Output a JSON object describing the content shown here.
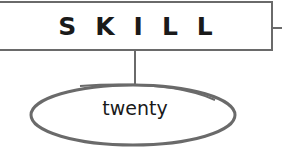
{
  "diagram": {
    "top_node": {
      "label": "SKILL"
    },
    "child_node": {
      "label": "twenty"
    },
    "colors": {
      "stroke": "#6a6a6a",
      "text": "#1a1a1a",
      "background": "#ffffff"
    }
  }
}
